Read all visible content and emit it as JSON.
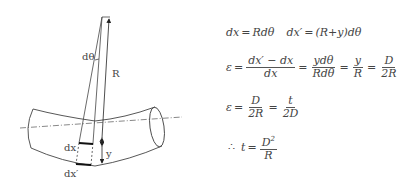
{
  "diagram": {
    "labels": {
      "dtheta": "dθ",
      "R": "R",
      "dx": "dx",
      "y": "y",
      "dx_prime": "dx′"
    }
  },
  "equations": {
    "row1": {
      "lhs1": "dx",
      "eq1": "=",
      "rhs1": "Rdθ",
      "lhs2": "dx′",
      "eq2": "=",
      "rhs2": "(R+y)dθ"
    },
    "row2": {
      "lhs": "ε",
      "eq": "=",
      "f1_num": "dx′ − dx",
      "f1_den": "dx",
      "f2_num": "ydθ",
      "f2_den": "Rdθ",
      "f3_num": "y",
      "f3_den": "R",
      "f4_num": "D",
      "f4_den": "2R"
    },
    "row3": {
      "lhs": "ε",
      "eq": "=",
      "f1_num": "D",
      "f1_den": "2R",
      "f2_num": "t",
      "f2_den": "2D"
    },
    "row4": {
      "therefore": "∴",
      "lhs": "t",
      "eq": "=",
      "f_num": "D",
      "f_num_exp": "2",
      "f_den": "R"
    }
  }
}
